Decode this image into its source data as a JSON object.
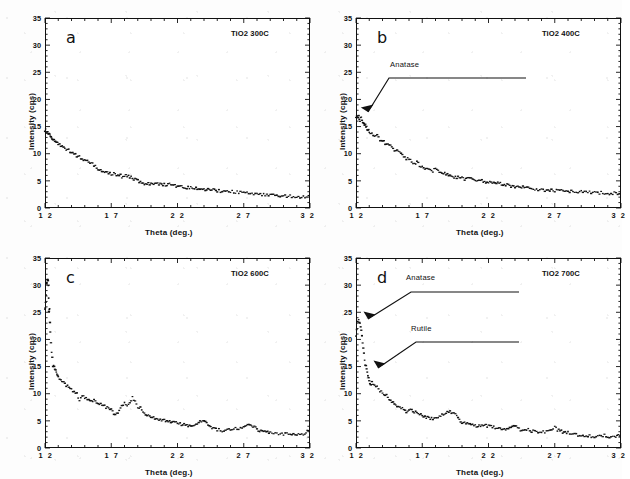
{
  "figure": {
    "type": "xrd-diffraction-multipanel",
    "panel_count": 4,
    "layout": "2x2 grid"
  },
  "axis": {
    "xlabel": "Theta (deg.)",
    "ylabel": "Intensity  (cps)",
    "xticks": [
      "1 2",
      "1 7",
      "2 2",
      "2 7",
      "3 2"
    ],
    "yticks": [
      "35",
      "30",
      "25",
      "20",
      "15",
      "10",
      "5",
      "0"
    ]
  },
  "panels": [
    {
      "letter": "a",
      "title": "TiO2 300C",
      "annotations": []
    },
    {
      "letter": "b",
      "title": "TiO2 400C",
      "annotations": [
        {
          "label": "Anatase"
        }
      ]
    },
    {
      "letter": "c",
      "title": "TiO2 600C",
      "annotations": []
    },
    {
      "letter": "d",
      "title": "TiO2 700C",
      "annotations": [
        {
          "label": "Anatase"
        },
        {
          "label": "Rutile"
        }
      ]
    }
  ],
  "chart_data": [
    {
      "panel": "a",
      "type": "scatter",
      "title": "TiO2 300C",
      "xlabel": "Theta (deg.)",
      "ylabel": "Intensity (cps)",
      "xlim": [
        12,
        32
      ],
      "ylim": [
        0,
        35
      ],
      "xticks": [
        12,
        17,
        22,
        27,
        32
      ],
      "yticks": [
        0,
        5,
        10,
        15,
        20,
        25,
        30,
        35
      ],
      "grid": false,
      "legend": null,
      "series": [
        {
          "name": "TiO2 300C",
          "x": [
            12.0,
            12.1,
            12.2,
            12.3,
            12.4,
            12.5,
            12.6,
            12.7,
            12.8,
            12.9,
            13.0,
            13.2,
            13.4,
            13.6,
            13.8,
            14.0,
            14.2,
            14.4,
            14.6,
            14.8,
            15.0,
            15.2,
            15.4,
            15.6,
            15.8,
            16.0,
            16.2,
            16.4,
            16.6,
            16.8,
            17.0,
            17.2,
            17.4,
            17.6,
            17.8,
            18.0,
            18.2,
            18.4,
            18.6,
            18.8,
            19.0,
            19.4,
            19.8,
            20.2,
            20.6,
            21.0,
            21.4,
            21.8,
            22.2,
            22.6,
            23.0,
            23.4,
            23.8,
            24.2,
            24.6,
            25.0,
            25.5,
            26.0,
            26.5,
            27.0,
            27.5,
            28.0,
            28.5,
            29.0,
            29.5,
            30.0,
            30.5,
            31.0,
            31.5,
            32.0
          ],
          "y": [
            14.4,
            14.2,
            13.8,
            13.5,
            13.2,
            13.0,
            12.6,
            12.5,
            12.2,
            12.0,
            11.8,
            11.4,
            11.2,
            10.8,
            10.6,
            10.2,
            10.0,
            9.7,
            9.4,
            9.2,
            8.9,
            8.6,
            8.3,
            8.1,
            7.6,
            7.3,
            7.0,
            6.9,
            6.7,
            6.5,
            6.2,
            6.3,
            5.9,
            6.2,
            5.8,
            5.9,
            6.0,
            5.7,
            5.5,
            5.2,
            5.0,
            4.6,
            4.5,
            4.4,
            4.5,
            4.3,
            4.4,
            4.1,
            3.9,
            3.8,
            3.7,
            3.6,
            3.6,
            3.4,
            3.3,
            3.2,
            3.1,
            3.0,
            2.9,
            2.8,
            2.7,
            2.6,
            2.5,
            2.4,
            2.3,
            2.3,
            2.2,
            2.2,
            2.1,
            2.1
          ]
        }
      ]
    },
    {
      "panel": "b",
      "type": "scatter",
      "title": "TiO2 400C",
      "xlabel": "Theta (deg.)",
      "ylabel": "Intensity (cps)",
      "xlim": [
        12,
        32
      ],
      "ylim": [
        0,
        35
      ],
      "xticks": [
        12,
        17,
        22,
        27,
        32
      ],
      "yticks": [
        0,
        5,
        10,
        15,
        20,
        25,
        30,
        35
      ],
      "grid": false,
      "legend": null,
      "annotations": [
        {
          "text": "Anatase",
          "points_to_x": 12.4,
          "points_to_y": 17.0
        }
      ],
      "series": [
        {
          "name": "TiO2 400C",
          "x": [
            12.0,
            12.1,
            12.2,
            12.3,
            12.4,
            12.5,
            12.6,
            12.7,
            12.8,
            12.9,
            13.0,
            13.2,
            13.4,
            13.6,
            13.8,
            14.0,
            14.2,
            14.4,
            14.6,
            14.8,
            15.0,
            15.2,
            15.4,
            15.6,
            15.8,
            16.0,
            16.2,
            16.4,
            16.6,
            16.8,
            17.0,
            17.2,
            17.4,
            17.6,
            17.8,
            18.0,
            18.2,
            18.4,
            18.6,
            18.8,
            19.0,
            19.4,
            19.8,
            20.2,
            20.6,
            21.0,
            21.4,
            21.8,
            22.2,
            22.6,
            23.0,
            23.4,
            23.8,
            24.2,
            24.6,
            25.0,
            25.5,
            26.0,
            26.5,
            27.0,
            27.5,
            28.0,
            28.5,
            29.0,
            29.5,
            30.0,
            30.5,
            31.0,
            31.5,
            32.0
          ],
          "y": [
            16.6,
            17.0,
            16.8,
            16.2,
            16.6,
            15.8,
            15.4,
            15.2,
            14.8,
            14.4,
            14.2,
            13.6,
            13.2,
            13.6,
            12.6,
            12.4,
            12.0,
            11.6,
            11.4,
            11.0,
            10.6,
            10.4,
            10.0,
            9.6,
            9.2,
            8.8,
            8.6,
            8.2,
            8.4,
            7.9,
            7.6,
            7.4,
            7.2,
            7.0,
            6.8,
            7.2,
            6.9,
            6.6,
            6.4,
            6.2,
            6.0,
            5.8,
            5.6,
            5.4,
            5.6,
            5.2,
            5.0,
            4.9,
            4.6,
            4.8,
            4.4,
            4.2,
            4.0,
            3.9,
            3.8,
            3.6,
            3.5,
            3.4,
            3.3,
            3.2,
            3.2,
            3.1,
            3.0,
            3.0,
            2.9,
            2.9,
            2.8,
            2.8,
            2.7,
            2.8
          ]
        }
      ]
    },
    {
      "panel": "c",
      "type": "scatter",
      "title": "TiO2 600C",
      "xlabel": "Theta (deg.)",
      "ylabel": "Intensity (cps)",
      "xlim": [
        12,
        32
      ],
      "ylim": [
        0,
        35
      ],
      "xticks": [
        12,
        17,
        22,
        27,
        32
      ],
      "yticks": [
        0,
        5,
        10,
        15,
        20,
        25,
        30,
        35
      ],
      "grid": false,
      "legend": null,
      "series": [
        {
          "name": "TiO2 600C",
          "x": [
            12.0,
            12.05,
            12.1,
            12.15,
            12.2,
            12.25,
            12.3,
            12.35,
            12.4,
            12.5,
            12.6,
            12.7,
            12.8,
            12.9,
            13.0,
            13.2,
            13.4,
            13.6,
            13.8,
            14.0,
            14.2,
            14.4,
            14.6,
            14.8,
            15.0,
            15.4,
            15.8,
            16.2,
            16.6,
            17.0,
            17.2,
            17.4,
            17.6,
            17.8,
            18.0,
            18.2,
            18.4,
            18.6,
            18.8,
            19.0,
            19.2,
            19.4,
            19.6,
            19.8,
            20.0,
            20.4,
            20.8,
            21.2,
            21.6,
            22.0,
            22.4,
            22.8,
            23.2,
            23.6,
            23.9,
            24.1,
            24.3,
            24.6,
            25.0,
            25.5,
            26.0,
            26.5,
            27.0,
            27.4,
            27.8,
            28.2,
            28.6,
            29.0,
            29.5,
            30.0,
            30.5,
            31.0,
            31.5,
            31.8,
            32.0
          ],
          "y": [
            25.5,
            26.6,
            30.2,
            30.4,
            31.2,
            30.0,
            25.2,
            25.4,
            21.2,
            17.8,
            15.2,
            14.8,
            14.2,
            13.6,
            13.0,
            12.4,
            12.0,
            11.6,
            11.2,
            10.8,
            10.4,
            10.0,
            8.7,
            9.6,
            9.4,
            9.0,
            8.6,
            8.2,
            7.6,
            7.0,
            6.4,
            6.2,
            7.0,
            7.8,
            8.2,
            7.8,
            8.6,
            9.2,
            8.4,
            7.4,
            7.8,
            6.6,
            6.2,
            6.0,
            5.8,
            5.4,
            5.2,
            5.0,
            4.8,
            4.6,
            4.4,
            4.2,
            4.2,
            4.6,
            5.2,
            4.8,
            4.2,
            3.6,
            3.4,
            3.2,
            3.4,
            3.6,
            4.0,
            4.2,
            3.8,
            3.2,
            2.9,
            2.8,
            2.7,
            2.6,
            2.5,
            2.4,
            2.6,
            3.0,
            2.9
          ]
        }
      ]
    },
    {
      "panel": "d",
      "type": "scatter",
      "title": "TiO2 700C",
      "xlabel": "Theta (deg.)",
      "ylabel": "Intensity (cps)",
      "xlim": [
        12,
        32
      ],
      "ylim": [
        0,
        35
      ],
      "xticks": [
        12,
        17,
        22,
        27,
        32
      ],
      "yticks": [
        0,
        5,
        10,
        15,
        20,
        25,
        30,
        35
      ],
      "grid": false,
      "legend": null,
      "annotations": [
        {
          "text": "Anatase",
          "points_to_x": 12.3,
          "points_to_y": 24.5
        },
        {
          "text": "Rutile",
          "points_to_x": 12.9,
          "points_to_y": 13.2
        }
      ],
      "series": [
        {
          "name": "TiO2 700C",
          "x": [
            12.0,
            12.1,
            12.2,
            12.3,
            12.4,
            12.5,
            12.6,
            12.7,
            12.8,
            12.9,
            13.0,
            13.1,
            13.2,
            13.4,
            13.6,
            13.8,
            14.0,
            14.2,
            14.4,
            14.6,
            14.8,
            15.0,
            15.4,
            15.8,
            16.2,
            16.6,
            17.0,
            17.4,
            17.8,
            18.2,
            18.6,
            19.0,
            19.4,
            19.6,
            19.8,
            20.0,
            20.4,
            20.8,
            21.2,
            21.6,
            22.0,
            22.4,
            22.8,
            23.2,
            23.6,
            24.0,
            24.2,
            24.5,
            25.0,
            25.5,
            26.0,
            26.5,
            27.0,
            27.2,
            27.6,
            28.0,
            28.5,
            29.0,
            29.5,
            30.0,
            30.5,
            31.0,
            31.5,
            31.8,
            32.0
          ],
          "y": [
            20.4,
            23.2,
            23.6,
            22.8,
            21.8,
            19.2,
            17.6,
            15.2,
            14.8,
            13.2,
            12.4,
            11.8,
            12.0,
            11.6,
            11.2,
            10.6,
            10.2,
            9.8,
            9.4,
            8.8,
            8.4,
            8.0,
            7.4,
            6.6,
            7.0,
            6.4,
            6.0,
            5.6,
            5.4,
            5.8,
            6.2,
            6.8,
            6.4,
            5.8,
            5.2,
            4.8,
            4.6,
            4.2,
            4.0,
            4.4,
            4.0,
            3.8,
            3.6,
            3.4,
            3.6,
            4.2,
            3.8,
            3.2,
            3.4,
            3.0,
            2.9,
            3.1,
            3.8,
            3.4,
            3.0,
            2.8,
            2.6,
            2.4,
            2.3,
            2.2,
            2.4,
            2.2,
            2.0,
            2.4,
            2.2
          ]
        }
      ]
    }
  ]
}
